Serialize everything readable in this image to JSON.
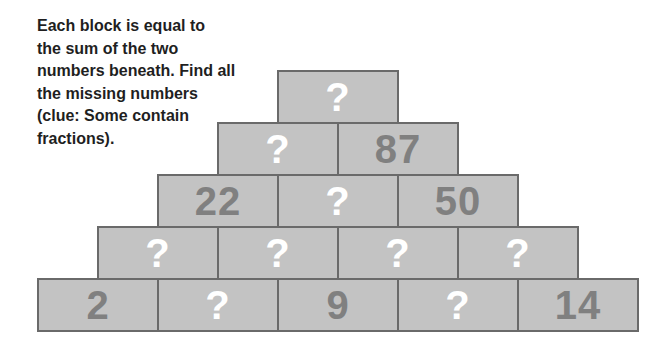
{
  "instructions": "Each block is equal to\nthe sum of the two\nnumbers beneath. Find all\nthe missing numbers\n(clue: Some contain\nfractions).",
  "colors": {
    "block_fill": "#c3c3c3",
    "block_border": "#6a6a6a",
    "known_text": "#808080",
    "unknown_text": "#ffffff"
  },
  "pyramid": {
    "rows": [
      {
        "row": 1,
        "blocks": [
          "?"
        ]
      },
      {
        "row": 2,
        "blocks": [
          "?",
          "87"
        ]
      },
      {
        "row": 3,
        "blocks": [
          "22",
          "?",
          "50"
        ]
      },
      {
        "row": 4,
        "blocks": [
          "?",
          "?",
          "?",
          "?"
        ]
      },
      {
        "row": 5,
        "blocks": [
          "2",
          "?",
          "9",
          "?",
          "14"
        ]
      }
    ]
  }
}
